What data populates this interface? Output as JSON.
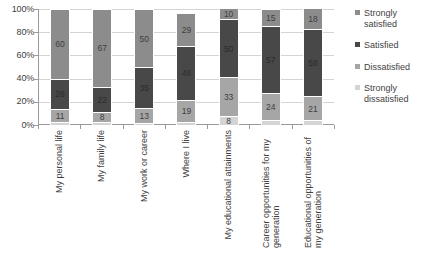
{
  "chart_data": {
    "type": "bar",
    "title": "",
    "subtitle": "",
    "xlabel": "",
    "ylabel": "",
    "stacked": true,
    "percent_stacked": true,
    "grid": true,
    "legend_position": "right",
    "ylim": [
      0,
      100
    ],
    "yticks": [
      "0%",
      "20%",
      "40%",
      "60%",
      "80%",
      "100%"
    ],
    "ytick_values": [
      0,
      20,
      40,
      60,
      80,
      100
    ],
    "categories": [
      "My personal life",
      "My family life",
      "My work or career",
      "Where I live",
      "My educational attainments",
      "Career opportunities for my generation",
      "Educational opportunities of my generation"
    ],
    "series": [
      {
        "name": "Strongly dissatisfied",
        "color": "#d4d4d4",
        "values": [
          3,
          3,
          2,
          3,
          8,
          4,
          4
        ]
      },
      {
        "name": "Dissatisfied",
        "color": "#a6a6a6",
        "values": [
          11,
          8,
          13,
          19,
          33,
          24,
          21
        ]
      },
      {
        "name": "Satisfied",
        "color": "#484848",
        "values": [
          26,
          22,
          35,
          46,
          50,
          57,
          58
        ]
      },
      {
        "name": "Strongly satisfied",
        "color": "#8c8c8c",
        "values": [
          60,
          67,
          50,
          29,
          10,
          15,
          18
        ]
      }
    ]
  },
  "legend": {
    "items": [
      {
        "label": "Strongly satisfied",
        "color": "#8c8c8c"
      },
      {
        "label": "Satisfied",
        "color": "#484848"
      },
      {
        "label": "Dissatisfied",
        "color": "#a6a6a6"
      },
      {
        "label": "Strongly dissatisfied",
        "color": "#d4d4d4"
      }
    ]
  },
  "colors": {
    "grid": "#d4d4d4",
    "axis": "#9a9a9a",
    "text": "#3f3f3f",
    "background": "#ffffff"
  }
}
